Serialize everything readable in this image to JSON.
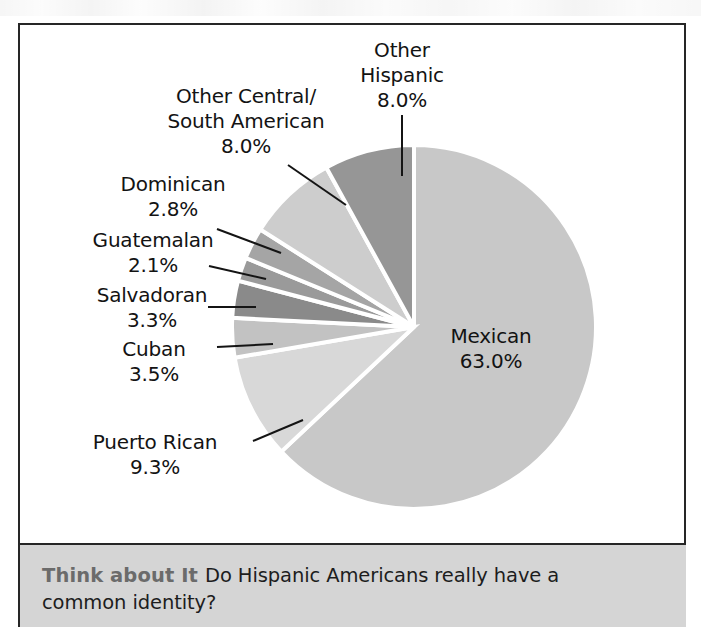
{
  "figure": {
    "chart_type": "pie"
  },
  "chart_data": {
    "type": "pie",
    "title": "",
    "subtitle": "",
    "xlabel": "",
    "ylabel": "",
    "legend_position": "none",
    "grid": false,
    "units": "percent",
    "categories": [
      "Mexican",
      "Puerto Rican",
      "Cuban",
      "Salvadoran",
      "Guatemalan",
      "Dominican",
      "Other Central/ South American",
      "Other Hispanic"
    ],
    "values": [
      63.0,
      9.3,
      3.5,
      3.3,
      2.1,
      2.8,
      8.0,
      8.0
    ],
    "slices": [
      {
        "label": "Mexican",
        "label_line1": "Mexican",
        "label_line2": "",
        "value": 63.0,
        "value_text": "63.0%",
        "color": "#c8c8c8"
      },
      {
        "label": "Puerto Rican",
        "label_line1": "Puerto Rican",
        "label_line2": "",
        "value": 9.3,
        "value_text": "9.3%",
        "color": "#d8d8d8"
      },
      {
        "label": "Cuban",
        "label_line1": "Cuban",
        "label_line2": "",
        "value": 3.5,
        "value_text": "3.5%",
        "color": "#c2c2c2"
      },
      {
        "label": "Salvadoran",
        "label_line1": "Salvadoran",
        "label_line2": "",
        "value": 3.3,
        "value_text": "3.3%",
        "color": "#8a8a8a"
      },
      {
        "label": "Guatemalan",
        "label_line1": "Guatemalan",
        "label_line2": "",
        "value": 2.1,
        "value_text": "2.1%",
        "color": "#9a9a9a"
      },
      {
        "label": "Dominican",
        "label_line1": "Dominican",
        "label_line2": "",
        "value": 2.8,
        "value_text": "2.8%",
        "color": "#a5a5a5"
      },
      {
        "label": "Other Central/ South American",
        "label_line1": "Other Central/",
        "label_line2": "South American",
        "value": 8.0,
        "value_text": "8.0%",
        "color": "#cdcdcd"
      },
      {
        "label": "Other Hispanic",
        "label_line1": "Other",
        "label_line2": "Hispanic",
        "value": 8.0,
        "value_text": "8.0%",
        "color": "#969696"
      }
    ]
  },
  "caption": {
    "label": "Think about It",
    "question_line1": "Do Hispanic Americans really have a",
    "question_line2": "common identity?",
    "full_question": "Do Hispanic Americans really have a common identity?"
  },
  "colors": {
    "frame": "#262626",
    "band_bg": "#d5d5d5",
    "label_text": "#131313",
    "caption_label": "#6b6b6b",
    "slice_divider": "#ffffff"
  }
}
